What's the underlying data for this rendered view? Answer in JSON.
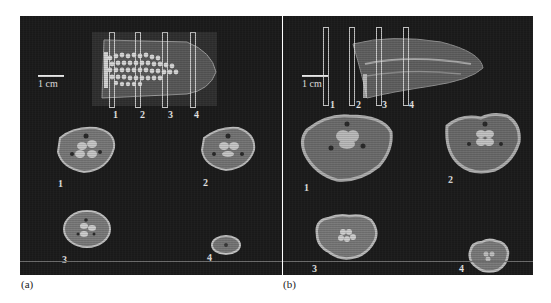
{
  "figure": {
    "panels": [
      {
        "id": "a",
        "label": "(a)",
        "scale_bar": "1 cm",
        "slice_labels": [
          "1",
          "2",
          "3",
          "4"
        ],
        "cross_section_labels": [
          "1",
          "2",
          "3",
          "4"
        ]
      },
      {
        "id": "b",
        "label": "(b)",
        "scale_bar": "1 cm",
        "slice_labels": [
          "1",
          "2",
          "3",
          "4"
        ],
        "cross_section_labels": [
          "1",
          "2",
          "3",
          "4"
        ]
      }
    ]
  }
}
